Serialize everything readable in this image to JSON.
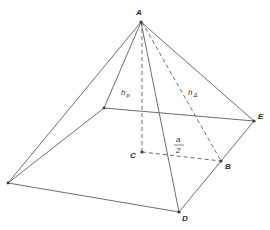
{
  "diagram": {
    "vertices": {
      "A": {
        "label": "A",
        "x": 141,
        "y": 22
      },
      "E": {
        "label": "E",
        "x": 254,
        "y": 121
      },
      "B": {
        "label": "B",
        "x": 221,
        "y": 161
      },
      "C": {
        "label": "C",
        "x": 142,
        "y": 152
      },
      "D": {
        "label": "D",
        "x": 179,
        "y": 212
      },
      "back_left": {
        "label": "",
        "x": 104,
        "y": 108
      },
      "front_left": {
        "label": "",
        "x": 8,
        "y": 183
      }
    },
    "labels": {
      "A": "A",
      "B": "B",
      "C": "C",
      "D": "D",
      "E": "E",
      "height_pyramid": "h",
      "height_pyramid_sub": "p",
      "height_triangle": "h",
      "height_triangle_sub": "Δ",
      "half_side_num": "a",
      "half_side_den": "2"
    },
    "colors": {
      "line": "#6e6e6e",
      "point": "#3a3a3a",
      "text": "#2a2a2a",
      "background": "#ffffff"
    }
  }
}
